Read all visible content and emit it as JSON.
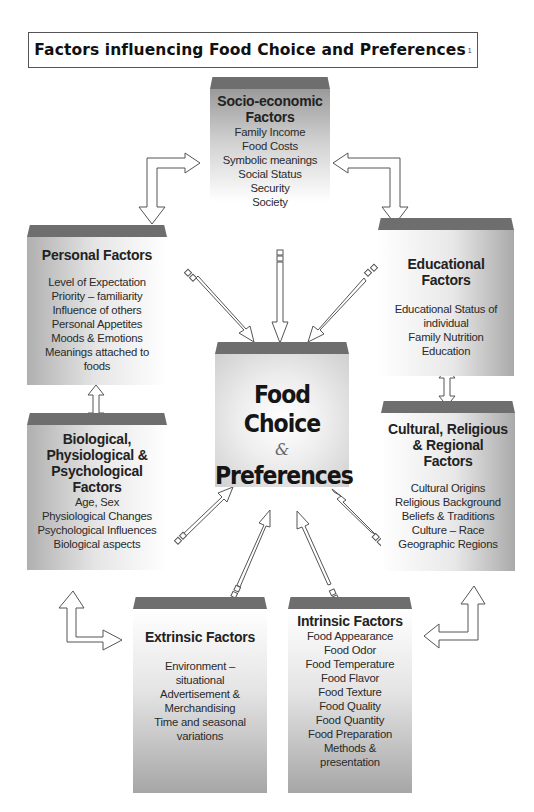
{
  "title": {
    "text": "Factors influencing Food Choice and Preferences",
    "footnote": "1"
  },
  "center": {
    "line1": "Food Choice",
    "amp": "&",
    "line2": "Preferences"
  },
  "socio_economic": {
    "heading_line1": "Socio-economic",
    "heading_line2": "Factors",
    "items": [
      "Family Income",
      "Food Costs",
      "Symbolic meanings",
      "Social Status",
      "Security",
      "Society"
    ]
  },
  "personal": {
    "heading": "Personal Factors",
    "items": [
      "Level of Expectation",
      "Priority – familiarity",
      "Influence of  others",
      "Personal Appetites",
      "Moods & Emotions",
      "Meanings attached to",
      "foods"
    ]
  },
  "educational": {
    "heading_line1": "Educational",
    "heading_line2": "Factors",
    "items": [
      "Educational Status of",
      "individual",
      "Family Nutrition",
      "Education"
    ]
  },
  "biological": {
    "heading_line1": "Biological,",
    "heading_line2": "Physiological &",
    "heading_line3": "Psychological",
    "heading_line4": "Factors",
    "items": [
      "Age, Sex",
      "Physiological Changes",
      "Psychological Influences",
      "Biological aspects"
    ]
  },
  "cultural": {
    "heading_line1": "Cultural, Religious",
    "heading_line2": "& Regional",
    "heading_line3": "Factors",
    "items": [
      "Cultural Origins",
      "Religious Background",
      "Beliefs & Traditions",
      "Culture – Race",
      "Geographic Regions"
    ]
  },
  "extrinsic": {
    "heading": "Extrinsic Factors",
    "items": [
      "Environment –",
      "situational",
      "Advertisement &",
      "Merchandising",
      "Time and seasonal",
      "variations"
    ]
  },
  "intrinsic": {
    "heading": "Intrinsic Factors",
    "items": [
      "Food Appearance",
      "Food Odor",
      "Food Temperature",
      "Food Flavor",
      "Food Texture",
      "Food Quality",
      "Food Quantity",
      "Food Preparation",
      "Methods &",
      "presentation"
    ]
  },
  "colors": {
    "cap": "#6e6e6e",
    "text": "#222222",
    "arrow_stroke": "#555555"
  }
}
